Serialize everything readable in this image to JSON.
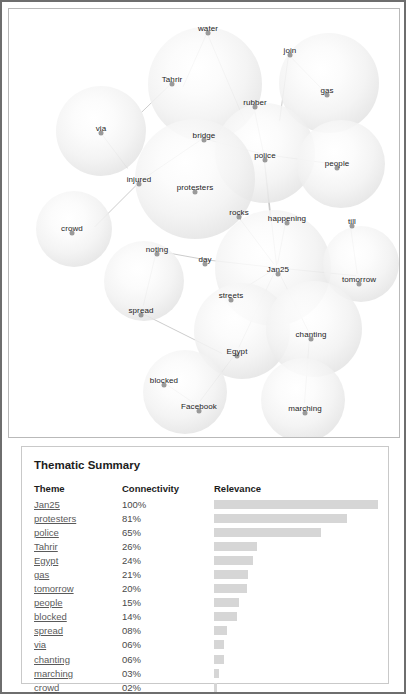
{
  "viz": {
    "name": "theme-bubble-graph",
    "nodes": [
      {
        "label": "water",
        "lx": 199,
        "ly": 19,
        "bx": 196,
        "by": 75,
        "r": 57
      },
      {
        "label": "Tahrir",
        "lx": 163,
        "ly": 70,
        "bx": 196,
        "by": 75,
        "r": 57
      },
      {
        "label": "join",
        "lx": 281,
        "ly": 41,
        "bx": 320,
        "by": 74,
        "r": 50
      },
      {
        "label": "gas",
        "lx": 318,
        "ly": 81,
        "bx": 320,
        "by": 74,
        "r": 50
      },
      {
        "label": "via",
        "lx": 92,
        "ly": 119,
        "bx": 92,
        "by": 122,
        "r": 45
      },
      {
        "label": "rubber",
        "lx": 246,
        "ly": 93,
        "bx": 256,
        "by": 144,
        "r": 50
      },
      {
        "label": "police",
        "lx": 256,
        "ly": 146,
        "bx": 256,
        "by": 144,
        "r": 50
      },
      {
        "label": "people",
        "lx": 328,
        "ly": 154,
        "bx": 332,
        "by": 155,
        "r": 44
      },
      {
        "label": "bridge",
        "lx": 195,
        "ly": 126,
        "bx": 186,
        "by": 170,
        "r": 60
      },
      {
        "label": "protesters",
        "lx": 186,
        "ly": 178,
        "bx": 186,
        "by": 170,
        "r": 60
      },
      {
        "label": "injured",
        "lx": 130,
        "ly": 170,
        "bx": 186,
        "by": 170,
        "r": 60
      },
      {
        "label": "crowd",
        "lx": 63,
        "ly": 219,
        "bx": 65,
        "by": 220,
        "r": 38
      },
      {
        "label": "rocks",
        "lx": 230,
        "ly": 203,
        "bx": 264,
        "by": 259,
        "r": 58
      },
      {
        "label": "happening",
        "lx": 278,
        "ly": 209,
        "bx": 264,
        "by": 259,
        "r": 58
      },
      {
        "label": "Jan25",
        "lx": 269,
        "ly": 260,
        "bx": 264,
        "by": 259,
        "r": 58
      },
      {
        "label": "day",
        "lx": 196,
        "ly": 250,
        "bx": 264,
        "by": 259,
        "r": 58
      },
      {
        "label": "streets",
        "lx": 222,
        "ly": 286,
        "bx": 264,
        "by": 259,
        "r": 58
      },
      {
        "label": "till",
        "lx": 343,
        "ly": 212,
        "bx": 352,
        "by": 255,
        "r": 38
      },
      {
        "label": "tomorrow",
        "lx": 350,
        "ly": 270,
        "bx": 352,
        "by": 255,
        "r": 38
      },
      {
        "label": "noting",
        "lx": 148,
        "ly": 240,
        "bx": 135,
        "by": 272,
        "r": 40
      },
      {
        "label": "spread",
        "lx": 132,
        "ly": 301,
        "bx": 135,
        "by": 272,
        "r": 40
      },
      {
        "label": "Egypt",
        "lx": 228,
        "ly": 342,
        "bx": 233,
        "by": 322,
        "r": 48
      },
      {
        "label": "chanting",
        "lx": 302,
        "ly": 325,
        "bx": 305,
        "by": 320,
        "r": 48
      },
      {
        "label": "blocked",
        "lx": 155,
        "ly": 371,
        "bx": 176,
        "by": 383,
        "r": 42
      },
      {
        "label": "Facebook",
        "lx": 190,
        "ly": 397,
        "bx": 176,
        "by": 383,
        "r": 42
      },
      {
        "label": "marching",
        "lx": 296,
        "ly": 399,
        "bx": 294,
        "by": 391,
        "r": 42
      }
    ],
    "edges": [
      {
        "x1": 199,
        "y1": 24,
        "x2": 175,
        "y2": 78
      },
      {
        "x1": 199,
        "y1": 24,
        "x2": 237,
        "y2": 113
      },
      {
        "x1": 163,
        "y1": 75,
        "x2": 133,
        "y2": 104
      },
      {
        "x1": 281,
        "y1": 46,
        "x2": 318,
        "y2": 84
      },
      {
        "x1": 281,
        "y1": 46,
        "x2": 272,
        "y2": 112
      },
      {
        "x1": 92,
        "y1": 124,
        "x2": 119,
        "y2": 160
      },
      {
        "x1": 246,
        "y1": 98,
        "x2": 256,
        "y2": 146
      },
      {
        "x1": 256,
        "y1": 146,
        "x2": 328,
        "y2": 156
      },
      {
        "x1": 256,
        "y1": 146,
        "x2": 195,
        "y2": 130
      },
      {
        "x1": 256,
        "y1": 146,
        "x2": 263,
        "y2": 214
      },
      {
        "x1": 256,
        "y1": 146,
        "x2": 269,
        "y2": 258
      },
      {
        "x1": 195,
        "y1": 130,
        "x2": 133,
        "y2": 172
      },
      {
        "x1": 133,
        "y1": 172,
        "x2": 86,
        "y2": 219
      },
      {
        "x1": 230,
        "y1": 208,
        "x2": 266,
        "y2": 256
      },
      {
        "x1": 278,
        "y1": 214,
        "x2": 270,
        "y2": 256
      },
      {
        "x1": 269,
        "y1": 260,
        "x2": 198,
        "y2": 252
      },
      {
        "x1": 269,
        "y1": 260,
        "x2": 226,
        "y2": 287
      },
      {
        "x1": 269,
        "y1": 260,
        "x2": 349,
        "y2": 268
      },
      {
        "x1": 269,
        "y1": 260,
        "x2": 302,
        "y2": 326
      },
      {
        "x1": 269,
        "y1": 260,
        "x2": 231,
        "y2": 340
      },
      {
        "x1": 343,
        "y1": 217,
        "x2": 350,
        "y2": 266
      },
      {
        "x1": 198,
        "y1": 252,
        "x2": 154,
        "y2": 244
      },
      {
        "x1": 148,
        "y1": 244,
        "x2": 135,
        "y2": 298
      },
      {
        "x1": 132,
        "y1": 305,
        "x2": 214,
        "y2": 346
      },
      {
        "x1": 228,
        "y1": 346,
        "x2": 192,
        "y2": 394
      },
      {
        "x1": 155,
        "y1": 375,
        "x2": 186,
        "y2": 396
      },
      {
        "x1": 302,
        "y1": 330,
        "x2": 297,
        "y2": 396
      }
    ]
  },
  "summary": {
    "title": "Thematic Summary",
    "columns": {
      "theme": "Theme",
      "connectivity": "Connectivity",
      "relevance": "Relevance"
    },
    "rows": [
      {
        "theme": "Jan25",
        "connectivity": "100%",
        "pct": 100
      },
      {
        "theme": "protesters",
        "connectivity": "81%",
        "pct": 81
      },
      {
        "theme": "police",
        "connectivity": "65%",
        "pct": 65
      },
      {
        "theme": "Tahrir",
        "connectivity": "26%",
        "pct": 26
      },
      {
        "theme": "Egypt",
        "connectivity": "24%",
        "pct": 24
      },
      {
        "theme": "gas",
        "connectivity": "21%",
        "pct": 21
      },
      {
        "theme": "tomorrow",
        "connectivity": "20%",
        "pct": 20
      },
      {
        "theme": "people",
        "connectivity": "15%",
        "pct": 15
      },
      {
        "theme": "blocked",
        "connectivity": "14%",
        "pct": 14
      },
      {
        "theme": "spread",
        "connectivity": "08%",
        "pct": 8
      },
      {
        "theme": "via",
        "connectivity": "06%",
        "pct": 6
      },
      {
        "theme": "chanting",
        "connectivity": "06%",
        "pct": 6
      },
      {
        "theme": "marching",
        "connectivity": "03%",
        "pct": 3
      },
      {
        "theme": "crowd",
        "connectivity": "02%",
        "pct": 2
      }
    ]
  },
  "chart_data": {
    "type": "bar",
    "title": "Thematic Summary",
    "xlabel": "Relevance",
    "ylabel": "Theme",
    "categories": [
      "Jan25",
      "protesters",
      "police",
      "Tahrir",
      "Egypt",
      "gas",
      "tomorrow",
      "people",
      "blocked",
      "spread",
      "via",
      "chanting",
      "marching",
      "crowd"
    ],
    "values": [
      100,
      81,
      65,
      26,
      24,
      21,
      20,
      15,
      14,
      8,
      6,
      6,
      3,
      2
    ],
    "value_labels": [
      "100%",
      "81%",
      "65%",
      "26%",
      "24%",
      "21%",
      "20%",
      "15%",
      "14%",
      "08%",
      "06%",
      "06%",
      "03%",
      "02%"
    ],
    "xlim": [
      0,
      100
    ],
    "grid": false,
    "legend": false,
    "orientation": "horizontal",
    "bar_color": "#d6d6d6"
  }
}
